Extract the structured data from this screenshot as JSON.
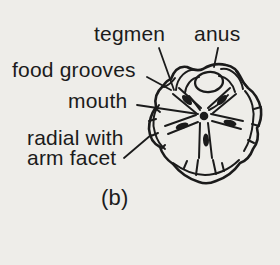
{
  "figure": {
    "labels": {
      "tegmen": "tegmen",
      "anus": "anus",
      "food_grooves": "food grooves",
      "mouth": "mouth",
      "radial_line1": "radial with",
      "radial_line2": "arm facet"
    },
    "caption": "(b)",
    "colors": {
      "paper": "#eeede9",
      "ink": "#1b1b1b"
    }
  }
}
